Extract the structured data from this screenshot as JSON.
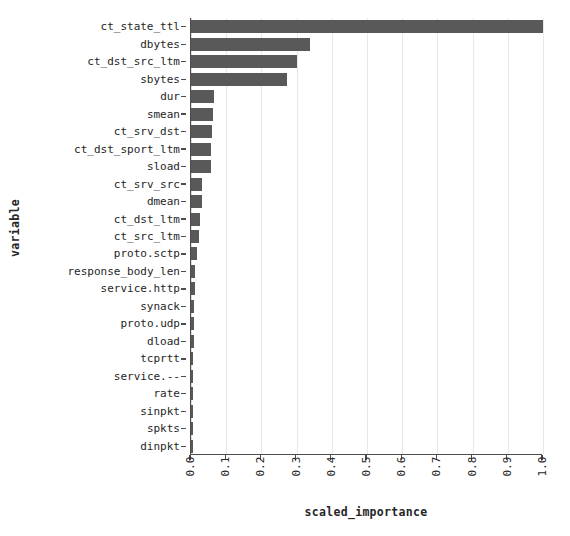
{
  "chart_data": {
    "type": "bar",
    "orientation": "horizontal",
    "title": "",
    "xlabel": "scaled_importance",
    "ylabel": "variable",
    "xlim": [
      0.0,
      1.0
    ],
    "grid": true,
    "legend": false,
    "bar_color": "#595959",
    "xticks": [
      "0.0",
      "0.1",
      "0.2",
      "0.3",
      "0.4",
      "0.5",
      "0.6",
      "0.7",
      "0.8",
      "0.9",
      "1.0"
    ],
    "categories": [
      "ct_state_ttl",
      "dbytes",
      "ct_dst_src_ltm",
      "sbytes",
      "dur",
      "smean",
      "ct_srv_dst",
      "ct_dst_sport_ltm",
      "sload",
      "ct_srv_src",
      "dmean",
      "ct_dst_ltm",
      "ct_src_ltm",
      "proto.sctp",
      "response_body_len",
      "service.http",
      "synack",
      "proto.udp",
      "dload",
      "tcprtt",
      "service.--",
      "rate",
      "sinpkt",
      "spkts",
      "dinpkt"
    ],
    "values": [
      1.0,
      0.337,
      0.3,
      0.274,
      0.064,
      0.063,
      0.059,
      0.058,
      0.056,
      0.032,
      0.03,
      0.026,
      0.024,
      0.016,
      0.012,
      0.01,
      0.009,
      0.009,
      0.008,
      0.007,
      0.007,
      0.006,
      0.005,
      0.004,
      0.003
    ]
  }
}
